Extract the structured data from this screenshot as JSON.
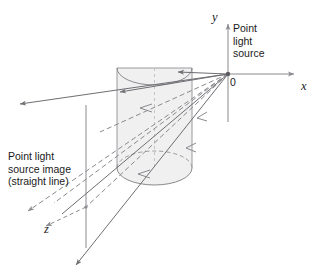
{
  "figure": {
    "width": 322,
    "height": 277,
    "background_color": "#ffffff"
  },
  "labels": {
    "point_light_source": "Point\nlight\nsource",
    "source_image": "Point light\nsource image\n(straight line)",
    "origin": "0",
    "axis_x": "x",
    "axis_y": "y",
    "axis_z": "z"
  },
  "colors": {
    "line": "#6e6e73",
    "line_dark": "#5a5a5f",
    "text": "#1a1a1a",
    "cylinder_fill": "#f0f0f0",
    "cylinder_stroke": "#9a9a9e",
    "dashed_stroke": "#8a8a8f"
  },
  "geometry": {
    "origin": {
      "x": 228,
      "y": 74
    },
    "axis_y_top": {
      "x": 228,
      "y": 22
    },
    "axis_y_bottom": {
      "x": 228,
      "y": 122
    },
    "axis_x_right": {
      "x": 298,
      "y": 74
    },
    "cylinder": {
      "left": 117,
      "right": 192,
      "top": 68,
      "bottom": 168,
      "ellipse_ry": 14
    },
    "image_line": {
      "x": 86,
      "y_top": 105,
      "y_bottom": 248
    },
    "image_node": {
      "x": 86,
      "y": 207
    }
  },
  "elements": {
    "cylinder_name": "cylinder-surface",
    "ray_count_solid": 4,
    "ray_count_dashed": 4
  }
}
